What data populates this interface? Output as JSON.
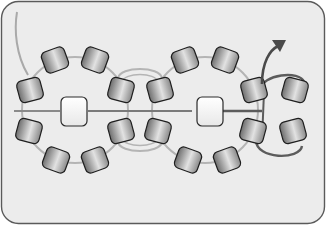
{
  "diagram": {
    "type": "beading-pattern",
    "panel": {
      "fill": "#ececec",
      "border": "#5a5a5a"
    },
    "colors": {
      "thread_light": "#a9a9a9",
      "thread_dark": "#5c5c5c",
      "bead_outline": "#1e1e1e",
      "bead_dark": "#6e6e6e",
      "bead_light": "#e2e2e2",
      "pearl_fill": "#ffffff",
      "arrow": "#4a4a4a"
    },
    "rings": [
      {
        "name": "left-ring",
        "center_bead": "pearl",
        "bead_count": 8
      },
      {
        "name": "right-ring",
        "center_bead": "pearl",
        "bead_count": 8
      }
    ],
    "cluster": {
      "name": "right-cluster",
      "bead_count": 4,
      "has_direction_arrow": true
    }
  }
}
